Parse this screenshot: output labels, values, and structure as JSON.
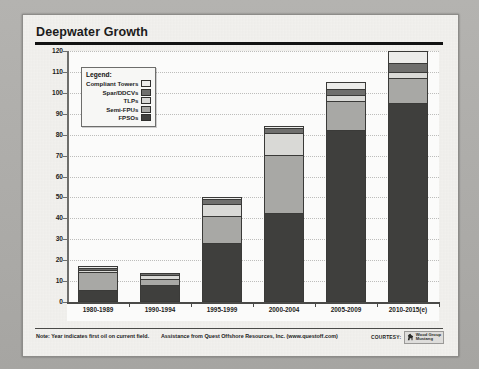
{
  "page": {
    "title": "Deepwater Growth"
  },
  "legend": {
    "title": "Legend:",
    "items": [
      {
        "label": "Compliant Towers",
        "color": "#ececea"
      },
      {
        "label": "Spar/DDCVs",
        "color": "#6f6f6d"
      },
      {
        "label": "TLPs",
        "color": "#d9d9d6"
      },
      {
        "label": "Semi-FPUs",
        "color": "#a8a8a5"
      },
      {
        "label": "FPSOs",
        "color": "#3f3f3d"
      }
    ]
  },
  "footer": {
    "note_1": "Note: Year indicates first oil on current field.",
    "note_2": "Assistance from Quest Offshore Resources, Inc. (www.questoff.com)",
    "courtesy_label": "COURTESY:",
    "logo_line_1": "Wood Group",
    "logo_line_2": "Mustang"
  },
  "chart_data": {
    "type": "bar",
    "title": "Deepwater Growth",
    "xlabel": "",
    "ylabel": "",
    "ylim": [
      0,
      120
    ],
    "yticks": [
      0,
      10,
      20,
      30,
      40,
      50,
      60,
      70,
      80,
      90,
      100,
      110,
      120
    ],
    "grid": true,
    "stacked": true,
    "legend_position": "inside-top-left",
    "categories": [
      "1980-1989",
      "1990-1994",
      "1995-1999",
      "2000-2004",
      "2005-2009",
      "2010-2015(e)"
    ],
    "series": [
      {
        "name": "FPSOs",
        "color": "#3f3f3d",
        "values": [
          5,
          8,
          28,
          42,
          82,
          95
        ]
      },
      {
        "name": "Semi-FPUs",
        "color": "#a8a8a5",
        "values": [
          9,
          3,
          13,
          28,
          14,
          12
        ]
      },
      {
        "name": "TLPs",
        "color": "#d9d9d6",
        "values": [
          1,
          2,
          6,
          11,
          3,
          3
        ]
      },
      {
        "name": "Spar/DDCVs",
        "color": "#6f6f6d",
        "values": [
          1,
          1,
          2,
          2,
          3,
          4
        ]
      },
      {
        "name": "Compliant Towers",
        "color": "#ececea",
        "values": [
          1,
          0,
          1,
          1,
          3,
          6
        ]
      }
    ],
    "totals": [
      17,
      14,
      50,
      84,
      105,
      120
    ]
  }
}
